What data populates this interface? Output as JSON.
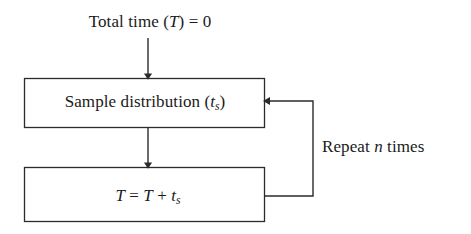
{
  "diagram": {
    "type": "flowchart",
    "background_color": "#ffffff",
    "stroke_color": "#2b2b2b",
    "text_color": "#1a1a1a",
    "labels": {
      "initial": {
        "prefix": "Total time (",
        "variable": "T",
        "suffix": ") = 0",
        "full_text": "Total time (T) = 0"
      },
      "sample_box": {
        "prefix": "Sample distribution (",
        "variable": "t",
        "subscript": "s",
        "suffix": ")",
        "full_text": "Sample distribution (ts)"
      },
      "accumulate_box": {
        "lhs": "T",
        "eq": " = ",
        "rhs_first": "T",
        "plus": " + ",
        "rhs_second": "t",
        "subscript": "s",
        "full_text": "T = T + ts"
      },
      "loop": {
        "prefix": "Repeat ",
        "variable": "n",
        "suffix": " times",
        "full_text": "Repeat n times"
      }
    },
    "nodes": [
      {
        "id": "sample-distribution-box",
        "x": 24,
        "y": 78,
        "width": 241,
        "height": 50
      },
      {
        "id": "accumulate-total-box",
        "x": 24,
        "y": 167,
        "width": 241,
        "height": 55
      }
    ],
    "edges": [
      {
        "id": "entry-arrow",
        "from": "initial-label",
        "to": "sample-distribution-box",
        "x": 148,
        "y1": 38,
        "y2": 78
      },
      {
        "id": "sequence-arrow",
        "from": "sample-distribution-box",
        "to": "accumulate-total-box",
        "x": 148,
        "y1": 128,
        "y2": 167
      },
      {
        "id": "feedback-loop",
        "from": "accumulate-total-box",
        "to": "sample-distribution-box",
        "exit_x": 265,
        "exit_y": 196,
        "corner_x": 313,
        "enter_y": 101,
        "enter_x": 265
      }
    ]
  }
}
